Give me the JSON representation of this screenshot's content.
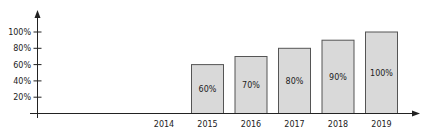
{
  "chart_data": {
    "type": "bar",
    "title": "",
    "xlabel": "",
    "ylabel": "",
    "categories": [
      "2014",
      "2015",
      "2016",
      "2017",
      "2018",
      "2019"
    ],
    "values": [
      null,
      60,
      70,
      80,
      90,
      100
    ],
    "bar_labels": [
      "",
      "60%",
      "70%",
      "80%",
      "90%",
      "100%"
    ],
    "y_ticks": [
      "20%",
      "40%",
      "60%",
      "80%",
      "100%"
    ],
    "y_tick_values": [
      20,
      40,
      60,
      80,
      100
    ],
    "ylim": [
      0,
      100
    ],
    "grid": false,
    "legend": null,
    "colors": {
      "bar_fill": "#d9d9d9",
      "bar_stroke": "#555555",
      "axis": "#222222"
    }
  }
}
